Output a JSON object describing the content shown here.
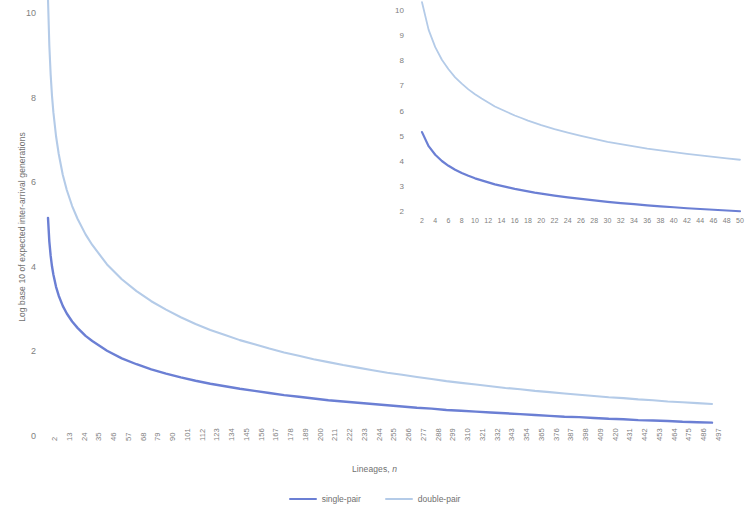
{
  "chart_data": {
    "type": "line",
    "title": "",
    "xlabel": "Lineages, n",
    "ylabel": "Log base 10 of expected inter-arrival generations",
    "xlim": [
      2,
      497
    ],
    "ylim": [
      0,
      10
    ],
    "grid": false,
    "legend_position": "bottom-center",
    "legend": [
      "single-pair",
      "double-pair"
    ],
    "colors": {
      "single_pair": "#6b7fd4",
      "double_pair": "#b4cbe8",
      "axis_text": "#808080",
      "title_text": "#6f6f6f",
      "background": "#ffffff"
    },
    "x_tick_labels": [
      "2",
      "13",
      "24",
      "35",
      "46",
      "57",
      "68",
      "79",
      "90",
      "101",
      "112",
      "123",
      "134",
      "145",
      "156",
      "167",
      "178",
      "189",
      "200",
      "211",
      "222",
      "233",
      "244",
      "255",
      "266",
      "277",
      "288",
      "299",
      "310",
      "321",
      "332",
      "343",
      "354",
      "365",
      "376",
      "387",
      "398",
      "409",
      "420",
      "431",
      "442",
      "453",
      "464",
      "475",
      "486",
      "497"
    ],
    "y_tick_labels": [
      "0",
      "2",
      "4",
      "6",
      "8",
      "10"
    ],
    "y_tick_values": [
      0,
      2,
      4,
      6,
      8,
      10
    ],
    "series": [
      {
        "name": "single-pair",
        "color": "#6b7fd4",
        "x": [
          2,
          3,
          4,
          5,
          6,
          8,
          10,
          13,
          16,
          20,
          24,
          30,
          35,
          46,
          57,
          68,
          79,
          90,
          101,
          112,
          123,
          134,
          145,
          156,
          167,
          178,
          189,
          200,
          211,
          222,
          233,
          244,
          255,
          266,
          277,
          288,
          299,
          310,
          321,
          332,
          343,
          354,
          365,
          376,
          387,
          398,
          409,
          420,
          431,
          442,
          453,
          464,
          475,
          486,
          497
        ],
        "y": [
          5.18,
          4.62,
          4.28,
          4.03,
          3.84,
          3.55,
          3.34,
          3.1,
          2.92,
          2.73,
          2.58,
          2.39,
          2.27,
          2.04,
          1.86,
          1.72,
          1.6,
          1.5,
          1.41,
          1.33,
          1.26,
          1.2,
          1.14,
          1.09,
          1.04,
          0.99,
          0.95,
          0.91,
          0.87,
          0.84,
          0.81,
          0.78,
          0.75,
          0.72,
          0.69,
          0.67,
          0.64,
          0.62,
          0.6,
          0.58,
          0.56,
          0.54,
          0.52,
          0.5,
          0.48,
          0.47,
          0.45,
          0.43,
          0.42,
          0.4,
          0.39,
          0.38,
          0.36,
          0.35,
          0.34
        ]
      },
      {
        "name": "double-pair",
        "color": "#b4cbe8",
        "x": [
          2,
          3,
          4,
          5,
          6,
          8,
          10,
          13,
          16,
          20,
          24,
          30,
          35,
          46,
          57,
          68,
          79,
          90,
          101,
          112,
          123,
          134,
          145,
          156,
          167,
          178,
          189,
          200,
          211,
          222,
          233,
          244,
          255,
          266,
          277,
          288,
          299,
          310,
          321,
          332,
          343,
          354,
          365,
          376,
          387,
          398,
          409,
          420,
          431,
          442,
          453,
          464,
          475,
          486,
          497
        ],
        "y": [
          10.35,
          9.25,
          8.56,
          8.06,
          7.68,
          7.11,
          6.69,
          6.2,
          5.84,
          5.46,
          5.16,
          4.79,
          4.54,
          4.08,
          3.73,
          3.45,
          3.21,
          3.01,
          2.83,
          2.67,
          2.53,
          2.41,
          2.29,
          2.19,
          2.09,
          2.0,
          1.92,
          1.84,
          1.77,
          1.7,
          1.64,
          1.58,
          1.52,
          1.47,
          1.42,
          1.37,
          1.32,
          1.28,
          1.24,
          1.2,
          1.16,
          1.13,
          1.09,
          1.06,
          1.03,
          1.0,
          0.97,
          0.94,
          0.92,
          0.89,
          0.87,
          0.84,
          0.82,
          0.8,
          0.78
        ]
      }
    ],
    "inset": {
      "type": "line",
      "xlim": [
        2,
        50
      ],
      "ylim": [
        2,
        10
      ],
      "grid": false,
      "x_tick_labels": [
        "2",
        "4",
        "6",
        "8",
        "10",
        "12",
        "14",
        "16",
        "18",
        "20",
        "22",
        "24",
        "26",
        "28",
        "30",
        "32",
        "34",
        "36",
        "38",
        "40",
        "42",
        "44",
        "46",
        "48",
        "50"
      ],
      "y_tick_labels": [
        "10",
        "9",
        "8",
        "7",
        "6",
        "5",
        "4",
        "3",
        "2"
      ],
      "y_tick_values": [
        10,
        9,
        8,
        7,
        6,
        5,
        4,
        3,
        2
      ],
      "series": [
        {
          "name": "single-pair",
          "color": "#6b7fd4",
          "x": [
            2,
            3,
            4,
            5,
            6,
            7,
            8,
            9,
            10,
            11,
            12,
            13,
            14,
            15,
            16,
            17,
            18,
            19,
            20,
            22,
            24,
            26,
            28,
            30,
            32,
            34,
            36,
            38,
            40,
            42,
            44,
            46,
            48,
            50
          ],
          "y": [
            5.18,
            4.62,
            4.28,
            4.03,
            3.84,
            3.68,
            3.55,
            3.44,
            3.34,
            3.26,
            3.18,
            3.1,
            3.04,
            2.98,
            2.92,
            2.87,
            2.82,
            2.77,
            2.73,
            2.65,
            2.58,
            2.52,
            2.46,
            2.4,
            2.35,
            2.31,
            2.26,
            2.22,
            2.19,
            2.15,
            2.12,
            2.09,
            2.06,
            2.03
          ]
        },
        {
          "name": "double-pair",
          "color": "#b4cbe8",
          "x": [
            2,
            3,
            4,
            5,
            6,
            7,
            8,
            9,
            10,
            11,
            12,
            13,
            14,
            15,
            16,
            17,
            18,
            19,
            20,
            22,
            24,
            26,
            28,
            30,
            32,
            34,
            36,
            38,
            40,
            42,
            44,
            46,
            48,
            50
          ],
          "y": [
            10.35,
            9.25,
            8.56,
            8.06,
            7.68,
            7.36,
            7.11,
            6.88,
            6.69,
            6.52,
            6.36,
            6.2,
            6.08,
            5.96,
            5.84,
            5.74,
            5.64,
            5.55,
            5.46,
            5.3,
            5.16,
            5.03,
            4.91,
            4.79,
            4.7,
            4.61,
            4.52,
            4.45,
            4.38,
            4.31,
            4.25,
            4.19,
            4.13,
            4.08
          ]
        }
      ]
    }
  }
}
